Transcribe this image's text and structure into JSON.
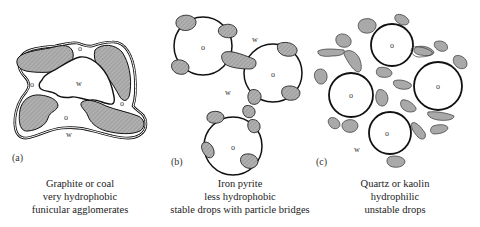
{
  "panels": [
    {
      "id": "a",
      "label": "(a)",
      "caption": [
        "Graphite or coal",
        "very hydrophobic",
        "funicular agglomerates"
      ],
      "region_labels": {
        "oil": "o",
        "water": "w"
      }
    },
    {
      "id": "b",
      "label": "(b)",
      "caption": [
        "Iron pyrite",
        "less hydrophobic",
        "stable drops with particle bridges"
      ],
      "region_labels": {
        "oil": "o",
        "water": "w"
      }
    },
    {
      "id": "c",
      "label": "(c)",
      "caption": [
        "Quartz or kaolin",
        "hydrophilic",
        "unstable drops"
      ],
      "region_labels": {
        "oil": "o",
        "water": "w"
      }
    }
  ],
  "colors": {
    "particle_fill": "#a9a9a9",
    "outline": "#111111",
    "background": "#ffffff"
  }
}
